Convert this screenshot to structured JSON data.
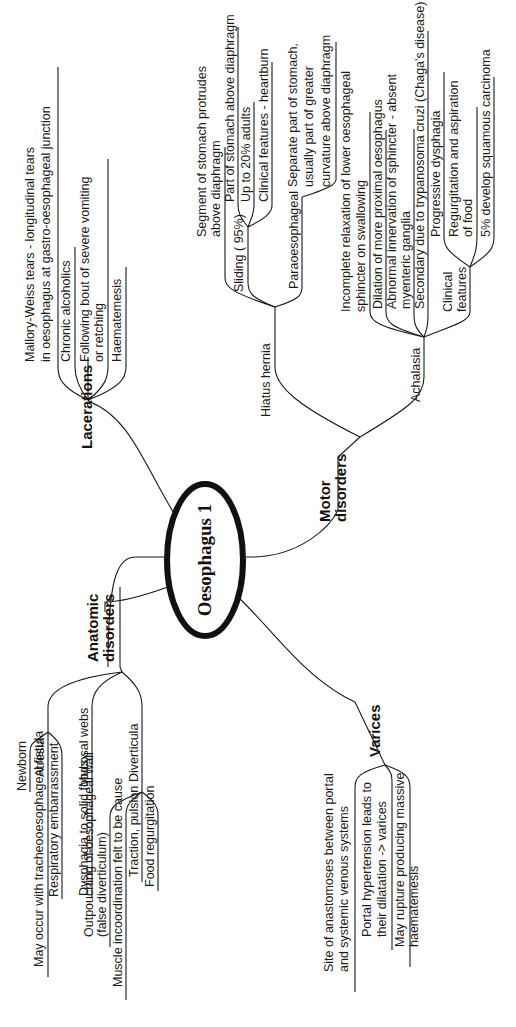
{
  "center": {
    "label": "Oesophagus 1"
  },
  "branches": {
    "lacerations": {
      "label": "Lacerations",
      "items": [
        {
          "lines": [
            "Mallory-Weiss tears - longitudinal tears",
            "in oesophagus at gastro-oesophageal junction"
          ]
        },
        {
          "lines": [
            "Chronic alcoholics"
          ]
        },
        {
          "lines": [
            "Following bout of severe vomiting",
            "or retching"
          ]
        },
        {
          "lines": [
            "Haematemesis"
          ]
        }
      ]
    },
    "anatomic": {
      "label_line1": "Anatomic",
      "label_line2": "disorders",
      "atresia": {
        "label": "Atresia",
        "items": [
          {
            "lines": [
              "Newborn"
            ]
          },
          {
            "lines": [
              "May occur with tracheooesophageal fistula"
            ]
          },
          {
            "lines": [
              "Respiratory embarrassment"
            ]
          }
        ]
      },
      "webs": {
        "label": "Mucosal webs",
        "items": [
          {
            "lines": [
              "Dysphagia to solid foods"
            ]
          }
        ]
      },
      "diverticula": {
        "label": "Diverticula",
        "items": [
          {
            "lines": [
              "Outpouching of oesophageal wall",
              "(false diverticulum)"
            ]
          },
          {
            "lines": [
              "Muscle incoordination felt to be cause"
            ]
          },
          {
            "lines": [
              "Traction, pulsion"
            ]
          },
          {
            "lines": [
              "Food regurgitation"
            ]
          }
        ]
      }
    },
    "varices": {
      "label": "Varices",
      "items": [
        {
          "lines": [
            "Site of anastomoses between portal",
            "and systemic venous systems"
          ]
        },
        {
          "lines": [
            "Portal hypertension leads to",
            "their dilatation -> varices"
          ]
        },
        {
          "lines": [
            "May rupture producing massive",
            "haematemesis"
          ]
        }
      ]
    },
    "motor": {
      "label_line1": "Motor",
      "label_line2": "disorders",
      "hiatus": {
        "label": "Hiatus hernia",
        "items": [
          {
            "lines": [
              "Segment of stomach protrudes",
              "above diaphragm"
            ]
          }
        ],
        "sliding": {
          "label": "Sliding ( 95%)",
          "items": [
            {
              "lines": [
                "Part of stomach above diaphragm"
              ]
            },
            {
              "lines": [
                "Up to 20% adults"
              ]
            },
            {
              "lines": [
                "Clinical features - heartburn"
              ]
            }
          ]
        },
        "paraoesophageal": {
          "label": "Paraoesophageal",
          "items": [
            {
              "lines": [
                "Separate part of stomach,",
                "usually part of greater",
                "curvature above diaphragm"
              ]
            }
          ]
        }
      },
      "achalasia": {
        "label": "Achalasia",
        "items": [
          {
            "lines": [
              "Incomplete relaxation of lower oesophageal",
              "sphincter on swallowing"
            ]
          },
          {
            "lines": [
              "Dilation of more proximal oesophagus"
            ]
          },
          {
            "lines": [
              "Abnormal innervation of sphincter - absent",
              "myenteric ganglia"
            ]
          },
          {
            "lines": [
              "Secondary due to trypanosoma cruzi (Chaga's disease)"
            ]
          }
        ],
        "clinical": {
          "label_line1": "Clinical",
          "label_line2": "features",
          "items": [
            {
              "lines": [
                "Progressive dysphagia"
              ]
            },
            {
              "lines": [
                "Regurgitation and aspiration",
                "of food"
              ]
            },
            {
              "lines": [
                "5% develop squamous carcinoma"
              ]
            }
          ]
        }
      }
    }
  }
}
